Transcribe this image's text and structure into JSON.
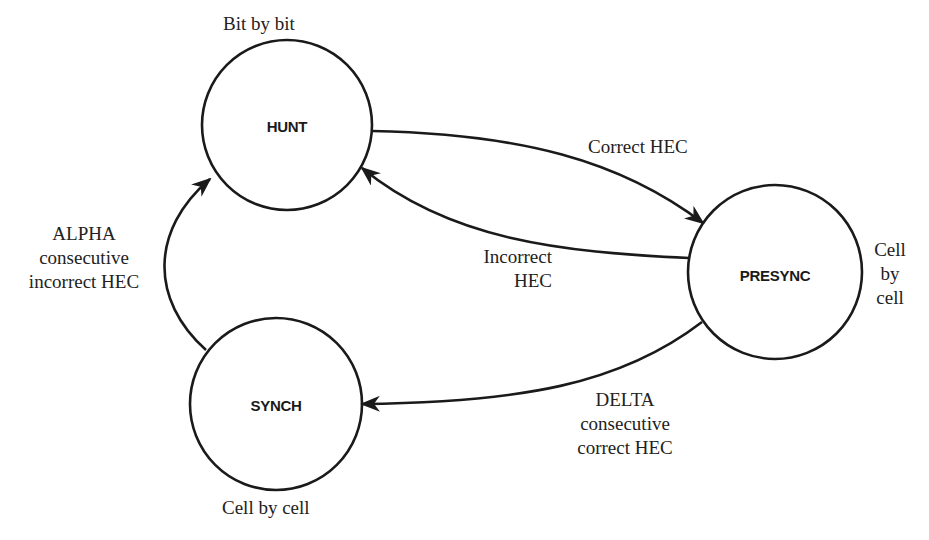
{
  "diagram": {
    "type": "state-machine",
    "states": [
      {
        "id": "hunt",
        "label": "HUNT",
        "annotation": "Bit by bit"
      },
      {
        "id": "presync",
        "label": "PRESYNC",
        "annotation": "Cell by cell"
      },
      {
        "id": "synch",
        "label": "SYNCH",
        "annotation": "Cell by cell"
      }
    ],
    "annotations": {
      "hunt": "Bit by bit",
      "presync_line1": "Cell",
      "presync_line2": "by",
      "presync_line3": "cell",
      "synch": "Cell by cell"
    },
    "transitions": [
      {
        "from": "hunt",
        "to": "presync",
        "label": "Correct HEC"
      },
      {
        "from": "presync",
        "to": "hunt",
        "label": "Incorrect HEC"
      },
      {
        "from": "presync",
        "to": "synch",
        "label": "DELTA consecutive correct HEC"
      },
      {
        "from": "synch",
        "to": "hunt",
        "label": "ALPHA consecutive incorrect HEC"
      }
    ],
    "edge_labels": {
      "correct_hec": "Correct HEC",
      "incorrect_line1": "Incorrect",
      "incorrect_line2": "HEC",
      "delta_line1": "DELTA",
      "delta_line2": "consecutive",
      "delta_line3": "correct HEC",
      "alpha_line1": "ALPHA",
      "alpha_line2": "consecutive",
      "alpha_line3": "incorrect HEC"
    },
    "colors": {
      "stroke": "#1a1a1a",
      "background": "#ffffff"
    }
  }
}
